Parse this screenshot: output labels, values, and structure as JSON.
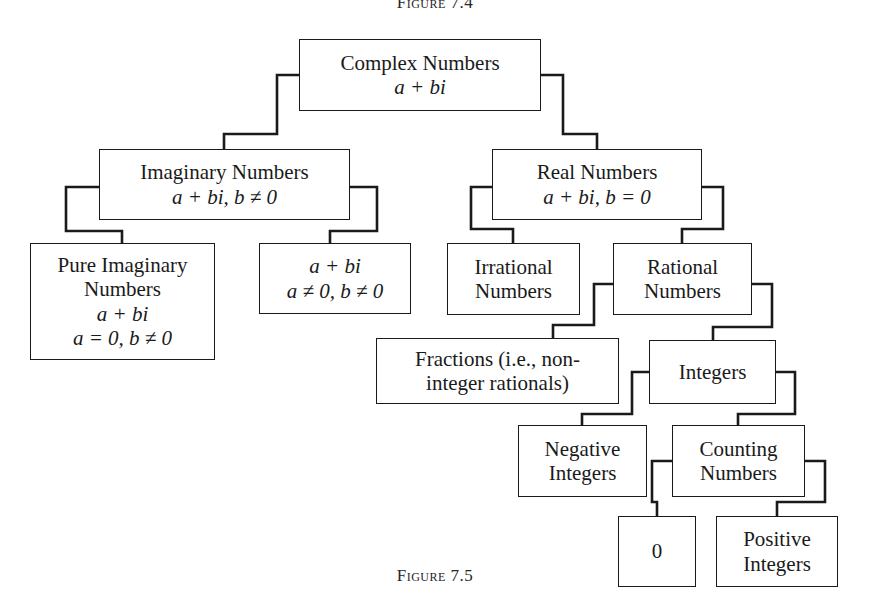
{
  "figure": {
    "caption_top": "Figure 7.4",
    "caption_bottom": "Figure 7.5"
  },
  "diagram": {
    "type": "tree",
    "nodes": {
      "complex": {
        "lines": [
          "Complex Numbers",
          "a + bi"
        ],
        "italic": [
          false,
          true
        ]
      },
      "imaginary": {
        "lines": [
          "Imaginary Numbers",
          "a + bi, b ≠ 0"
        ],
        "italic": [
          false,
          true
        ]
      },
      "real": {
        "lines": [
          "Real Numbers",
          "a + bi, b = 0"
        ],
        "italic": [
          false,
          true
        ]
      },
      "pure_imaginary": {
        "lines": [
          "Pure Imaginary",
          "Numbers",
          "a + bi",
          "a = 0, b ≠ 0"
        ],
        "italic": [
          false,
          false,
          true,
          true
        ]
      },
      "nonreal_nonpure": {
        "lines": [
          "a + bi",
          "a ≠ 0, b ≠ 0"
        ],
        "italic": [
          true,
          true
        ]
      },
      "irrational": {
        "lines": [
          "Irrational",
          "Numbers"
        ],
        "italic": [
          false,
          false
        ]
      },
      "rational": {
        "lines": [
          "Rational",
          "Numbers"
        ],
        "italic": [
          false,
          false
        ]
      },
      "fractions": {
        "lines": [
          "Fractions (i.e., non-",
          "integer rationals)"
        ],
        "italic": [
          false,
          false
        ]
      },
      "integers": {
        "lines": [
          "Integers"
        ],
        "italic": [
          false
        ]
      },
      "negative_integers": {
        "lines": [
          "Negative",
          "Integers"
        ],
        "italic": [
          false,
          false
        ]
      },
      "counting_numbers": {
        "lines": [
          "Counting",
          "Numbers"
        ],
        "italic": [
          false,
          false
        ]
      },
      "zero": {
        "lines": [
          "0"
        ],
        "italic": [
          false
        ]
      },
      "positive_integers": {
        "lines": [
          "Positive",
          "Integers"
        ],
        "italic": [
          false,
          false
        ]
      }
    },
    "edges": [
      {
        "from": "complex",
        "to": "imaginary"
      },
      {
        "from": "complex",
        "to": "real"
      },
      {
        "from": "imaginary",
        "to": "pure_imaginary"
      },
      {
        "from": "imaginary",
        "to": "nonreal_nonpure"
      },
      {
        "from": "real",
        "to": "irrational"
      },
      {
        "from": "real",
        "to": "rational"
      },
      {
        "from": "rational",
        "to": "fractions"
      },
      {
        "from": "rational",
        "to": "integers"
      },
      {
        "from": "integers",
        "to": "negative_integers"
      },
      {
        "from": "integers",
        "to": "counting_numbers"
      },
      {
        "from": "counting_numbers",
        "to": "zero"
      },
      {
        "from": "counting_numbers",
        "to": "positive_integers"
      }
    ],
    "colors": {
      "line": "#1a1a1a",
      "box_fill": "#ffffff",
      "text": "#1a1a1a"
    }
  }
}
